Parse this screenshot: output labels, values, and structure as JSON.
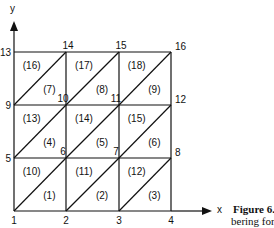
{
  "diagram": {
    "axes": {
      "x_label": "x",
      "y_label": "y"
    },
    "nodes": [
      {
        "id": "1",
        "col": 0,
        "row": 0
      },
      {
        "id": "2",
        "col": 1,
        "row": 0
      },
      {
        "id": "3",
        "col": 2,
        "row": 0
      },
      {
        "id": "4",
        "col": 3,
        "row": 0
      },
      {
        "id": "5",
        "col": 0,
        "row": 1
      },
      {
        "id": "6",
        "col": 1,
        "row": 1
      },
      {
        "id": "7",
        "col": 2,
        "row": 1
      },
      {
        "id": "8",
        "col": 3,
        "row": 1
      },
      {
        "id": "9",
        "col": 0,
        "row": 2
      },
      {
        "id": "10",
        "col": 1,
        "row": 2
      },
      {
        "id": "11",
        "col": 2,
        "row": 2
      },
      {
        "id": "12",
        "col": 3,
        "row": 2
      },
      {
        "id": "13",
        "col": 0,
        "row": 3
      },
      {
        "id": "14",
        "col": 1,
        "row": 3
      },
      {
        "id": "15",
        "col": 2,
        "row": 3
      },
      {
        "id": "16",
        "col": 3,
        "row": 3
      }
    ],
    "elements": [
      {
        "label": "(1)",
        "col": 0,
        "row": 0,
        "half": "lower"
      },
      {
        "label": "(2)",
        "col": 1,
        "row": 0,
        "half": "lower"
      },
      {
        "label": "(3)",
        "col": 2,
        "row": 0,
        "half": "lower"
      },
      {
        "label": "(4)",
        "col": 0,
        "row": 1,
        "half": "lower"
      },
      {
        "label": "(5)",
        "col": 1,
        "row": 1,
        "half": "lower"
      },
      {
        "label": "(6)",
        "col": 2,
        "row": 1,
        "half": "lower"
      },
      {
        "label": "(7)",
        "col": 0,
        "row": 2,
        "half": "lower"
      },
      {
        "label": "(8)",
        "col": 1,
        "row": 2,
        "half": "lower"
      },
      {
        "label": "(9)",
        "col": 2,
        "row": 2,
        "half": "lower"
      },
      {
        "label": "(10)",
        "col": 0,
        "row": 0,
        "half": "upper"
      },
      {
        "label": "(11)",
        "col": 1,
        "row": 0,
        "half": "upper"
      },
      {
        "label": "(12)",
        "col": 2,
        "row": 0,
        "half": "upper"
      },
      {
        "label": "(13)",
        "col": 0,
        "row": 1,
        "half": "upper"
      },
      {
        "label": "(14)",
        "col": 1,
        "row": 1,
        "half": "upper"
      },
      {
        "label": "(15)",
        "col": 2,
        "row": 1,
        "half": "upper"
      },
      {
        "label": "(16)",
        "col": 0,
        "row": 2,
        "half": "upper"
      },
      {
        "label": "(17)",
        "col": 1,
        "row": 2,
        "half": "upper"
      },
      {
        "label": "(18)",
        "col": 2,
        "row": 2,
        "half": "upper"
      }
    ]
  },
  "caption": {
    "bold": "Figure 6.",
    "line1_rest": "",
    "line2": "bering for"
  }
}
